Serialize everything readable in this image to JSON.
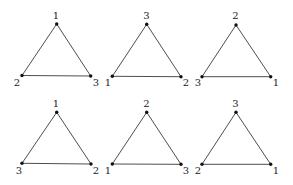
{
  "diagram": {
    "colors": {
      "edge": "#3a3a3a",
      "vertex": "#111111",
      "label": "#222222"
    },
    "triangles": [
      {
        "id": "t1",
        "vertices": [
          {
            "pos": "top",
            "x": 56.7,
            "y": 24.0,
            "label": "1",
            "lx": 56.0,
            "ly": 18.5,
            "anchor": "middle"
          },
          {
            "pos": "bottom-left",
            "x": 22.0,
            "y": 75.5,
            "label": "2",
            "lx": 17.0,
            "ly": 86.0,
            "anchor": "middle"
          },
          {
            "pos": "bottom-right",
            "x": 90.7,
            "y": 76.0,
            "label": "3",
            "lx": 96.0,
            "ly": 86.0,
            "anchor": "middle"
          }
        ]
      },
      {
        "id": "t2",
        "vertices": [
          {
            "pos": "top",
            "x": 146.7,
            "y": 24.3,
            "label": "3",
            "lx": 146.5,
            "ly": 18.5,
            "anchor": "middle"
          },
          {
            "pos": "bottom-left",
            "x": 112.3,
            "y": 76.3,
            "label": "1",
            "lx": 108.0,
            "ly": 86.0,
            "anchor": "middle"
          },
          {
            "pos": "bottom-right",
            "x": 181.0,
            "y": 76.7,
            "label": "2",
            "lx": 186.0,
            "ly": 86.0,
            "anchor": "middle"
          }
        ]
      },
      {
        "id": "t3",
        "vertices": [
          {
            "pos": "top",
            "x": 236.0,
            "y": 25.0,
            "label": "2",
            "lx": 235.5,
            "ly": 19.0,
            "anchor": "middle"
          },
          {
            "pos": "bottom-left",
            "x": 202.0,
            "y": 76.7,
            "label": "3",
            "lx": 198.0,
            "ly": 86.0,
            "anchor": "middle"
          },
          {
            "pos": "bottom-right",
            "x": 270.7,
            "y": 76.7,
            "label": "1",
            "lx": 276.0,
            "ly": 86.0,
            "anchor": "middle"
          }
        ]
      },
      {
        "id": "t4",
        "vertices": [
          {
            "pos": "top",
            "x": 56.7,
            "y": 112.3,
            "label": "1",
            "lx": 56.0,
            "ly": 107.0,
            "anchor": "middle"
          },
          {
            "pos": "bottom-left",
            "x": 22.0,
            "y": 163.3,
            "label": "3",
            "lx": 19.0,
            "ly": 174.0,
            "anchor": "middle"
          },
          {
            "pos": "bottom-right",
            "x": 91.0,
            "y": 164.0,
            "label": "2",
            "lx": 96.0,
            "ly": 174.0,
            "anchor": "middle"
          }
        ]
      },
      {
        "id": "t5",
        "vertices": [
          {
            "pos": "top",
            "x": 146.7,
            "y": 112.3,
            "label": "2",
            "lx": 146.5,
            "ly": 106.5,
            "anchor": "middle"
          },
          {
            "pos": "bottom-left",
            "x": 112.3,
            "y": 164.0,
            "label": "1",
            "lx": 108.0,
            "ly": 174.0,
            "anchor": "middle"
          },
          {
            "pos": "bottom-right",
            "x": 181.0,
            "y": 164.3,
            "label": "3",
            "lx": 186.0,
            "ly": 174.0,
            "anchor": "middle"
          }
        ]
      },
      {
        "id": "t6",
        "vertices": [
          {
            "pos": "top",
            "x": 236.0,
            "y": 112.3,
            "label": "3",
            "lx": 235.5,
            "ly": 106.5,
            "anchor": "middle"
          },
          {
            "pos": "bottom-left",
            "x": 202.0,
            "y": 164.3,
            "label": "2",
            "lx": 198.0,
            "ly": 174.0,
            "anchor": "middle"
          },
          {
            "pos": "bottom-right",
            "x": 270.7,
            "y": 164.3,
            "label": "1",
            "lx": 276.0,
            "ly": 174.0,
            "anchor": "middle"
          }
        ]
      }
    ]
  }
}
